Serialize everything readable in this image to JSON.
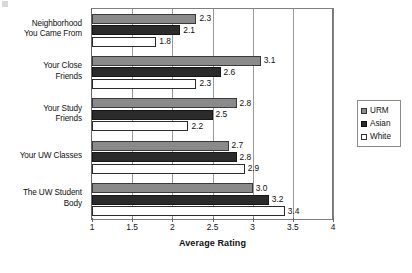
{
  "chart_data": {
    "type": "bar",
    "orientation": "horizontal",
    "title": "",
    "xlabel": "Average Rating",
    "ylabel": "",
    "xlim": [
      1,
      4
    ],
    "xticks": [
      "1",
      "1.5",
      "2",
      "2.5",
      "3",
      "3.5",
      "4"
    ],
    "xtick_values": [
      1,
      1.5,
      2,
      2.5,
      3,
      3.5,
      4
    ],
    "grid": true,
    "grid_axis": "x",
    "legend_position": "right",
    "categories": [
      "Neighborhood You Came From",
      "Your Close Friends",
      "Your Study Friends",
      "Your UW Classes",
      "The UW Student Body"
    ],
    "category_lines": [
      [
        "Neighborhood",
        "You Came From"
      ],
      [
        "Your Close",
        "Friends"
      ],
      [
        "Your Study",
        "Friends"
      ],
      [
        "Your UW Classes"
      ],
      [
        "The UW Student",
        "Body"
      ]
    ],
    "series": [
      {
        "name": "URM",
        "color": "#8a8a8a",
        "values": [
          2.3,
          3.1,
          2.8,
          2.7,
          3.0
        ],
        "labels": [
          "2.3",
          "3.1",
          "2.8",
          "2.7",
          "3.0"
        ]
      },
      {
        "name": "Asian",
        "color": "#2b2b2b",
        "values": [
          2.1,
          2.6,
          2.5,
          2.8,
          3.2
        ],
        "labels": [
          "2.1",
          "2.6",
          "2.5",
          "2.8",
          "3.2"
        ]
      },
      {
        "name": "White",
        "color": "#ffffff",
        "values": [
          1.8,
          2.3,
          2.2,
          2.9,
          3.4
        ],
        "labels": [
          "1.8",
          "2.3",
          "2.2",
          "2.9",
          "3.4"
        ]
      }
    ]
  },
  "legend": {
    "items": [
      {
        "label": "URM",
        "swatch": "urm"
      },
      {
        "label": "Asian",
        "swatch": "asian"
      },
      {
        "label": "White",
        "swatch": "white"
      }
    ]
  },
  "axis": {
    "x_title": "Average Rating"
  }
}
